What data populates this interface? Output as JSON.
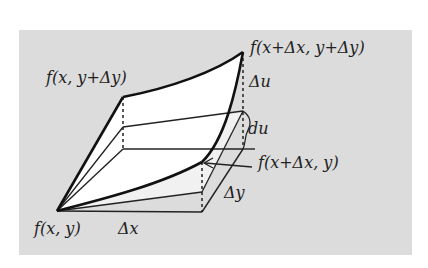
{
  "diagram": {
    "background_color": "#dcdcdc",
    "labels": {
      "f_x_y": "f(x, y)",
      "f_x_ydy": "f(x, y+Δy)",
      "f_xdx_ydy": "f(x+Δx, y+Δy)",
      "f_xdx_y": "f(x+Δx, y)",
      "delta_x": "Δx",
      "delta_y": "Δy",
      "delta_u": "Δu",
      "du": "du"
    }
  }
}
